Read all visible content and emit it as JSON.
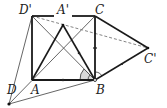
{
  "diagram": {
    "type": "geometry",
    "points": {
      "D_prime": {
        "label": "D'",
        "x": 32,
        "y": 16
      },
      "A_prime": {
        "label": "A'",
        "x": 63,
        "y": 25
      },
      "C": {
        "label": "C",
        "x": 95,
        "y": 16
      },
      "A": {
        "label": "A",
        "x": 32,
        "y": 80
      },
      "B": {
        "label": "B",
        "x": 95,
        "y": 80
      },
      "C_prime": {
        "label": "C'",
        "x": 148,
        "y": 48
      },
      "D": {
        "label": "D",
        "x": 9,
        "y": 104
      }
    },
    "labels": {
      "D_prime": "D'",
      "A_prime": "A'",
      "C": "C",
      "A": "A",
      "B": "B",
      "C_prime": "C'",
      "D": "D"
    },
    "colors": {
      "thick_line": "#1a1a1a",
      "thin_line": "#555555",
      "dashed_line": "#777777",
      "angle_fill": "#d8d8d8"
    }
  }
}
